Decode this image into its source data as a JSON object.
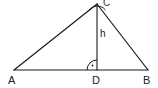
{
  "figure": {
    "type": "geometry-diagram",
    "background_color": "#ffffff",
    "stroke_color": "#1a1a1a",
    "text_color": "#222222"
  },
  "vertices": [
    {
      "id": "A",
      "label": "A",
      "x": 14,
      "y": 70,
      "label_x": 8,
      "label_y": 75
    },
    {
      "id": "B",
      "label": "B",
      "x": 148,
      "y": 70,
      "label_x": 143,
      "label_y": 75
    },
    {
      "id": "C",
      "label": "C",
      "x": 97,
      "y": 4,
      "label_x": 103,
      "label_y": -2
    },
    {
      "id": "D",
      "label": "D",
      "x": 97,
      "y": 70,
      "label_x": 92,
      "label_y": 75
    }
  ],
  "segments": [
    {
      "name": "side-AC",
      "from": "A",
      "to": "C"
    },
    {
      "name": "side-CB",
      "from": "C",
      "to": "B"
    },
    {
      "name": "base-AB",
      "from": "A",
      "to": "B"
    },
    {
      "name": "altitude-CD",
      "from": "C",
      "to": "D"
    }
  ],
  "labels": {
    "altitude": "h",
    "altitude_x": 100,
    "altitude_y": 29
  },
  "markers": {
    "apex_angle_arc": {
      "at": "C",
      "radius": 9
    },
    "right_angle": {
      "at": "D",
      "type": "arc-with-dot",
      "radius": 10
    }
  }
}
